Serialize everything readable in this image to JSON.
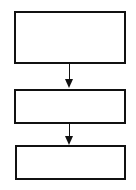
{
  "diagram": {
    "type": "flowchart",
    "direction": "top-to-bottom",
    "stroke_color": "#111111",
    "background_color": "#ffffff",
    "nodes": [
      {
        "id": "box-1",
        "label": ""
      },
      {
        "id": "box-2",
        "label": ""
      },
      {
        "id": "box-3",
        "label": ""
      }
    ],
    "edges": [
      {
        "from": "box-1",
        "to": "box-2"
      },
      {
        "from": "box-2",
        "to": "box-3"
      }
    ]
  }
}
